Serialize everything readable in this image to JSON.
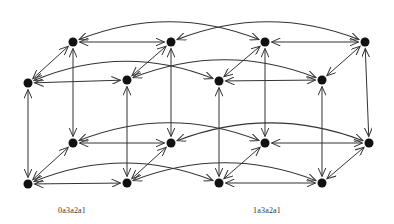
{
  "diagram": {
    "type": "hypercube-graph",
    "edge_color": "#333333",
    "node_color": "#111111",
    "node_radius": 4.5,
    "nodes": [
      {
        "id": "TB0",
        "x": 73,
        "y": 42
      },
      {
        "id": "TB1",
        "x": 171,
        "y": 42
      },
      {
        "id": "TB2",
        "x": 265,
        "y": 42
      },
      {
        "id": "TB3",
        "x": 365,
        "y": 42
      },
      {
        "id": "TF0",
        "x": 28,
        "y": 83
      },
      {
        "id": "TF1",
        "x": 127,
        "y": 80
      },
      {
        "id": "TF2",
        "x": 219,
        "y": 81
      },
      {
        "id": "TF3",
        "x": 322,
        "y": 80
      },
      {
        "id": "BB0",
        "x": 73,
        "y": 143
      },
      {
        "id": "BB1",
        "x": 171,
        "y": 143
      },
      {
        "id": "BB2",
        "x": 265,
        "y": 143
      },
      {
        "id": "BB3",
        "x": 369,
        "y": 143
      },
      {
        "id": "BF0",
        "x": 28,
        "y": 184
      },
      {
        "id": "BF1",
        "x": 127,
        "y": 183
      },
      {
        "id": "BF2",
        "x": 219,
        "y": 183
      },
      {
        "id": "BF3",
        "x": 322,
        "y": 183
      }
    ],
    "straight_edges": [
      [
        "TB0",
        "TB1"
      ],
      [
        "TB2",
        "TB3"
      ],
      [
        "TF0",
        "TF1"
      ],
      [
        "TF2",
        "TF3"
      ],
      [
        "BB0",
        "BB1"
      ],
      [
        "BB2",
        "BB3"
      ],
      [
        "BF0",
        "BF1"
      ],
      [
        "BF2",
        "BF3"
      ],
      [
        "TB0",
        "TF0"
      ],
      [
        "TB1",
        "TF1"
      ],
      [
        "TB2",
        "TF2"
      ],
      [
        "TB3",
        "TF3"
      ],
      [
        "BB0",
        "BF0"
      ],
      [
        "BB1",
        "BF1"
      ],
      [
        "BB2",
        "BF2"
      ],
      [
        "BB3",
        "BF3"
      ],
      [
        "TF0",
        "BF0"
      ],
      [
        "TF1",
        "BF1"
      ],
      [
        "TF2",
        "BF2"
      ],
      [
        "TF3",
        "BF3"
      ],
      [
        "TB0",
        "BB0"
      ],
      [
        "TB1",
        "BB1"
      ],
      [
        "TB2",
        "BB2"
      ],
      [
        "TB3",
        "BB3"
      ]
    ],
    "arc_edges": [
      [
        "TB0",
        "TB2"
      ],
      [
        "TB1",
        "TB3"
      ],
      [
        "TF0",
        "TF2"
      ],
      [
        "TF1",
        "TF3"
      ],
      [
        "BB0",
        "BB2"
      ],
      [
        "BB1",
        "BB3"
      ],
      [
        "BF0",
        "BF2"
      ],
      [
        "BF1",
        "BF3"
      ]
    ],
    "labels": [
      {
        "text": "0a3a2a1",
        "x": 58,
        "y": 206
      },
      {
        "text": "1a3a2a1",
        "x": 253,
        "y": 206
      }
    ]
  }
}
